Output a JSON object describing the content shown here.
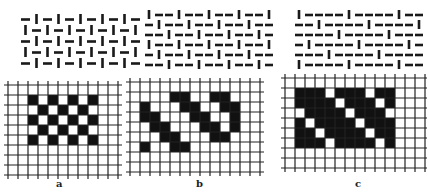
{
  "figure": {
    "panels": [
      {
        "id": "a",
        "label": "a",
        "name": "plain-weave",
        "weave_origin": [
          20,
          15
        ],
        "weave_cols": 7,
        "weave_rows": 5,
        "weave_cell": [
          15,
          12
        ],
        "grid_origin": [
          8,
          85
        ],
        "grid_cols": 11,
        "grid_rows": 9,
        "cell": 10,
        "black_cells": [
          [
            1,
            2
          ],
          [
            1,
            4
          ],
          [
            1,
            6
          ],
          [
            1,
            8
          ],
          [
            2,
            3
          ],
          [
            2,
            5
          ],
          [
            2,
            7
          ],
          [
            3,
            2
          ],
          [
            3,
            4
          ],
          [
            3,
            6
          ],
          [
            3,
            8
          ],
          [
            4,
            3
          ],
          [
            4,
            5
          ],
          [
            4,
            7
          ],
          [
            5,
            2
          ],
          [
            5,
            4
          ],
          [
            5,
            6
          ],
          [
            5,
            8
          ]
        ],
        "label_pos": [
          56,
          178
        ]
      },
      {
        "id": "b",
        "label": "b",
        "name": "twill-weave",
        "weave_origin": [
          146,
          12
        ],
        "weave_cols": 10,
        "weave_rows": 6,
        "weave_cell": [
          10,
          10
        ],
        "grid_origin": [
          130,
          82
        ],
        "grid_cols": 13,
        "grid_rows": 9,
        "cell": 10,
        "black_cells": [
          [
            1,
            4
          ],
          [
            1,
            5
          ],
          [
            1,
            8
          ],
          [
            1,
            9
          ],
          [
            2,
            1
          ],
          [
            2,
            5
          ],
          [
            2,
            6
          ],
          [
            2,
            9
          ],
          [
            2,
            10
          ],
          [
            3,
            1
          ],
          [
            3,
            2
          ],
          [
            3,
            6
          ],
          [
            3,
            7
          ],
          [
            3,
            10
          ],
          [
            4,
            2
          ],
          [
            4,
            3
          ],
          [
            4,
            7
          ],
          [
            4,
            8
          ],
          [
            4,
            10
          ],
          [
            5,
            3
          ],
          [
            5,
            4
          ],
          [
            5,
            8
          ],
          [
            5,
            9
          ],
          [
            6,
            1
          ],
          [
            6,
            4
          ],
          [
            6,
            5
          ]
        ],
        "label_pos": [
          196,
          178
        ]
      },
      {
        "id": "c",
        "label": "c",
        "name": "satin-weave",
        "weave_origin": [
          296,
          12
        ],
        "weave_cols": 11,
        "weave_rows": 6,
        "weave_cell": [
          10,
          10
        ],
        "grid_origin": [
          285,
          78
        ],
        "grid_cols": 14,
        "grid_rows": 9,
        "cell": 10,
        "black_region": [
          1,
          1,
          6,
          10
        ],
        "white_cells": [
          [
            1,
            4
          ],
          [
            1,
            8
          ],
          [
            2,
            5
          ],
          [
            2,
            9
          ],
          [
            3,
            1
          ],
          [
            3,
            6
          ],
          [
            3,
            10
          ],
          [
            4,
            2
          ],
          [
            4,
            7
          ],
          [
            5,
            3
          ],
          [
            5,
            8
          ],
          [
            6,
            4
          ],
          [
            6,
            9
          ]
        ],
        "label_pos": [
          355,
          178
        ]
      }
    ]
  }
}
